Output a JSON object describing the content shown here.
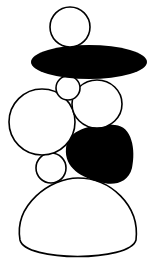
{
  "illustration": {
    "title": "Stacked stones cairn",
    "colors": {
      "background": "#ffffff",
      "stroke": "#000000",
      "fill_dark": "#000000",
      "fill_light": "#ffffff"
    },
    "stones": [
      {
        "name": "top-stone",
        "fill": "light"
      },
      {
        "name": "black-flat-stone",
        "fill": "dark"
      },
      {
        "name": "small-middle-stone",
        "fill": "light"
      },
      {
        "name": "right-middle-stone",
        "fill": "light"
      },
      {
        "name": "left-large-stone",
        "fill": "light"
      },
      {
        "name": "black-lower-stone",
        "fill": "dark"
      },
      {
        "name": "small-lower-stone",
        "fill": "light"
      },
      {
        "name": "base-stone",
        "fill": "light"
      }
    ]
  }
}
